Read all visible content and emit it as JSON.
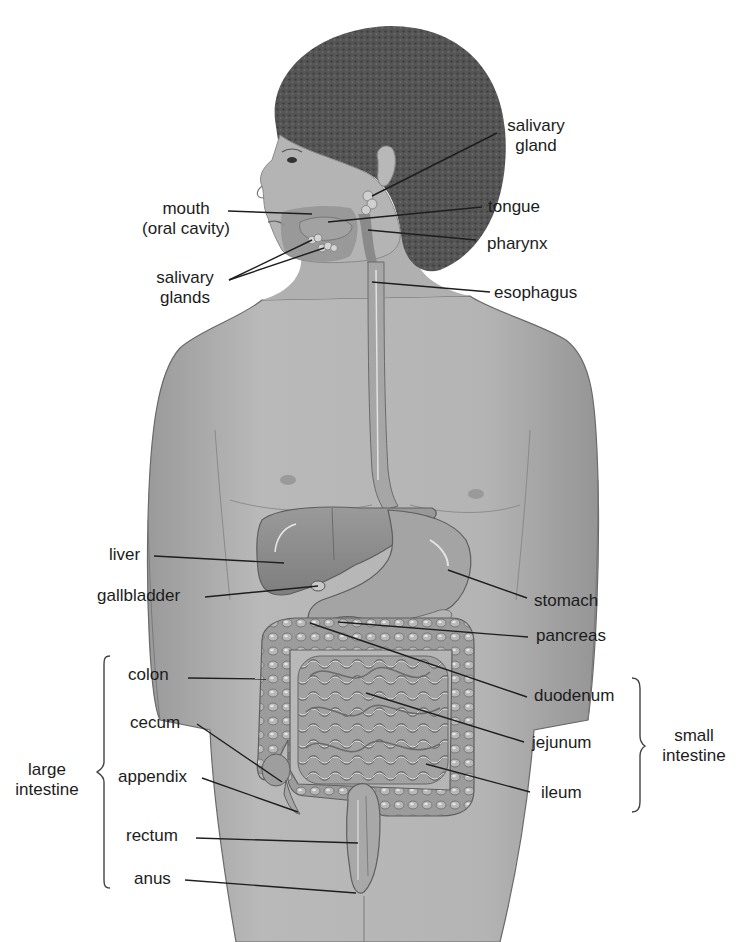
{
  "diagram": {
    "colors": {
      "background": "#ffffff",
      "label_text": "#1c1c1c",
      "leader_line": "#1e1e1e",
      "skin": "#a9a9a9",
      "hair": "#4a4a4a",
      "organ": "#8c8c8c",
      "organ_highlight": "#d8d8d8"
    },
    "labels": {
      "salivary_gland_right": {
        "line1": "salivary",
        "line2": "gland"
      },
      "mouth": {
        "line1": "mouth",
        "line2": "(oral cavity)"
      },
      "tongue": "tongue",
      "pharynx": "pharynx",
      "salivary_glands_left": {
        "line1": "salivary",
        "line2": "glands"
      },
      "esophagus": "esophagus",
      "liver": "liver",
      "gallbladder": "gallbladder",
      "stomach": "stomach",
      "pancreas": "pancreas",
      "colon": "colon",
      "duodenum": "duodenum",
      "cecum": "cecum",
      "jejunum": "jejunum",
      "appendix": "appendix",
      "ileum": "ileum",
      "rectum": "rectum",
      "anus": "anus"
    },
    "groups": {
      "large_intestine": {
        "line1": "large",
        "line2": "intestine",
        "members": [
          "colon",
          "cecum",
          "appendix",
          "rectum",
          "anus"
        ]
      },
      "small_intestine": {
        "line1": "small",
        "line2": "intestine",
        "members": [
          "duodenum",
          "jejunum",
          "ileum"
        ]
      }
    }
  }
}
